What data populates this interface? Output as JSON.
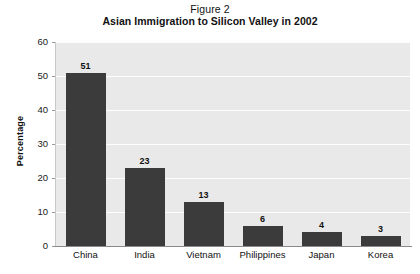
{
  "figure": {
    "label": "Figure 2"
  },
  "chart_data": {
    "type": "bar",
    "title": "Asian Immigration to Silicon Valley in 2002",
    "subtitle": "Figure 2",
    "xlabel": "",
    "ylabel": "Percentage",
    "ylim": [
      0,
      60
    ],
    "ytick_labels": [
      "60",
      "50",
      "40",
      "30",
      "20",
      "10",
      "0"
    ],
    "ytick_values": [
      60,
      50,
      40,
      30,
      20,
      10,
      0
    ],
    "grid": true,
    "legend": "none",
    "categories": [
      "China",
      "India",
      "Vietnam",
      "Philippines",
      "Japan",
      "Korea"
    ],
    "values": [
      51,
      23,
      13,
      6,
      4,
      3
    ],
    "value_labels": [
      "51",
      "23",
      "13",
      "6",
      "4",
      "3"
    ],
    "bar_color": "#3b3b3b",
    "plot_background": "#e9e9e9",
    "gridline_color": "#fdfdfd",
    "page_background": "#ffffff"
  }
}
